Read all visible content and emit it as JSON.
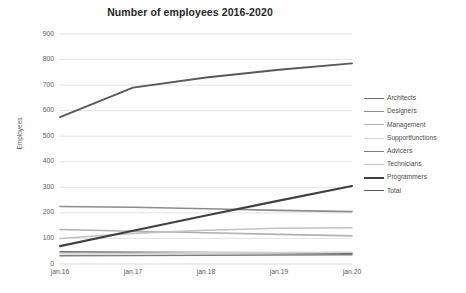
{
  "chart_data": {
    "type": "line",
    "title": "Number of employees 2016-2020",
    "xlabel": "",
    "ylabel": "Employees",
    "categories": [
      "jan.16",
      "jan.17",
      "jan.18",
      "jan.19",
      "jan.20"
    ],
    "ylim": [
      0,
      900
    ],
    "ytick_step": 100,
    "yticks": [
      "0",
      "100",
      "200",
      "300",
      "400",
      "500",
      "600",
      "700",
      "800",
      "900"
    ],
    "grid": true,
    "grid_axis": "y",
    "legend_position": "right",
    "series": [
      {
        "name": "Architects",
        "color": "#6b6b6b",
        "width": 1.6,
        "values": [
          48,
          46,
          45,
          44,
          42
        ]
      },
      {
        "name": "Designers",
        "color": "#8c8c8c",
        "width": 1.6,
        "values": [
          225,
          222,
          216,
          210,
          205
        ]
      },
      {
        "name": "Management",
        "color": "#b0b0b0",
        "width": 1.6,
        "values": [
          135,
          128,
          122,
          116,
          110
        ]
      },
      {
        "name": "Supportfunctions",
        "color": "#d2d2d2",
        "width": 1.6,
        "values": [
          40,
          42,
          44,
          45,
          46
        ]
      },
      {
        "name": "Advicers",
        "color": "#7d7d7d",
        "width": 1.6,
        "values": [
          32,
          33,
          34,
          35,
          36
        ]
      },
      {
        "name": "Technicians",
        "color": "#c2c2c2",
        "width": 1.6,
        "values": [
          100,
          120,
          132,
          140,
          142
        ]
      },
      {
        "name": "Programmers",
        "color": "#404040",
        "width": 2.1,
        "values": [
          70,
          130,
          190,
          248,
          305
        ]
      },
      {
        "name": "Total",
        "color": "#595959",
        "width": 1.9,
        "values": [
          575,
          690,
          730,
          760,
          785
        ]
      }
    ]
  },
  "plot": {
    "left": 60,
    "right": 352,
    "top": 34,
    "bottom": 264,
    "gridline_color": "#e3e3e3",
    "axis_color": "#d9d9d9"
  }
}
